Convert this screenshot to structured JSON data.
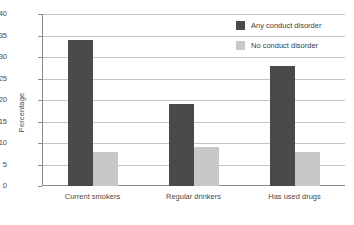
{
  "chart_data": {
    "type": "bar",
    "title": "",
    "xlabel": "",
    "ylabel": "Percentage",
    "ylim": [
      0,
      40
    ],
    "yticks": [
      0,
      5,
      10,
      15,
      20,
      25,
      30,
      35,
      40
    ],
    "grid": true,
    "legend_position": "top-right",
    "categories": [
      "Current smokers",
      "Regular drinkers",
      "Has used drugs"
    ],
    "series": [
      {
        "name": "Any conduct disorder",
        "color": "#4a4a4a",
        "values": [
          34,
          19,
          28
        ]
      },
      {
        "name": "No conduct disorder",
        "color": "#c8c8c8",
        "values": [
          8,
          9,
          8
        ]
      }
    ]
  },
  "axis": {
    "y_title": "Percentage",
    "y_tick_labels": [
      "0",
      "5",
      "10",
      "15",
      "20",
      "25",
      "30",
      "35",
      "40"
    ],
    "x_tick_labels": [
      "Current smokers",
      "Regular drinkers",
      "Has used drugs"
    ]
  },
  "legend": {
    "items": [
      {
        "label": "Any conduct disorder",
        "swatch": "dark"
      },
      {
        "label": "No conduct disorder",
        "swatch": "light"
      }
    ]
  },
  "colors": {
    "series_dark": "#4a4a4a",
    "series_light": "#c8c8c8",
    "gridline": "#c5c5c5",
    "axis": "#8a8a8a",
    "text": "#3d3d3d",
    "background": "#ffffff"
  }
}
